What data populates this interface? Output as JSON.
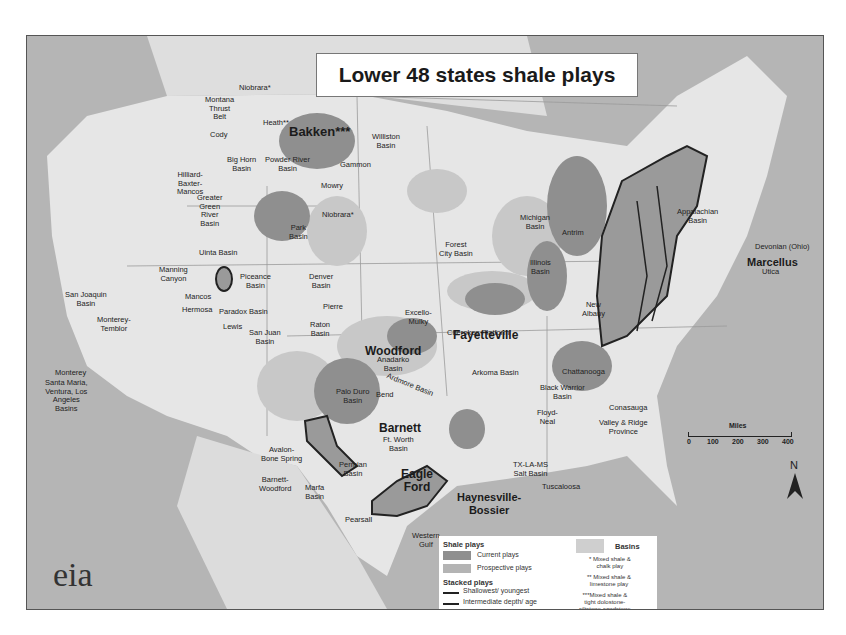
{
  "title": "Lower 48 states shale plays",
  "logo": "eia",
  "big_labels": {
    "bakken": "Bakken***",
    "marcellus": "Marcellus",
    "woodford": "Woodford",
    "fayetteville": "Fayetteville",
    "barnett": "Barnett",
    "eagle_ford": "Eagle\nFord",
    "haynesville": "Haynesville-\nBossier"
  },
  "labels": {
    "niobrara_n": "Niobrara*",
    "montana": "Montana\nThrust\nBelt",
    "heath": "Heath**",
    "williston": "Williston\nBasin",
    "gammon": "Gammon",
    "cody": "Cody",
    "bighorn": "Big Horn\nBasin",
    "powder": "Powder River\nBasin",
    "mowry": "Mowry",
    "hilliard": "Hilliard-\nBaxter-\nMancos",
    "greater_green": "Greater\nGreen\nRiver\nBasin",
    "niobrara_s": "Niobrara*",
    "park": "Park\nBasin",
    "uinta": "Uinta Basin",
    "manning": "Manning\nCanyon",
    "mancos": "Mancos",
    "hermosa": "Hermosa",
    "piceance": "Piceance\nBasin",
    "denver": "Denver\nBasin",
    "paradox": "Paradox Basin",
    "lewis": "Lewis",
    "san_juan": "San Juan\nBasin",
    "pierre": "Pierre",
    "raton": "Raton\nBasin",
    "san_joaquin": "San Joaquin\nBasin",
    "monterey_temblor": "Monterey-\nTemblor",
    "monterey": "Monterey",
    "santa_maria": "Santa Maria,\nVentura, Los\nAngeles\nBasins",
    "forest_city": "Forest\nCity Basin",
    "michigan": "Michigan\nBasin",
    "antrim": "Antrim",
    "illinois": "Illinois\nBasin",
    "new_albany": "New\nAlbany",
    "appalachian": "Appalachian\nBasin",
    "devonian": "Devonian (Ohio)",
    "utica": "Utica",
    "excello": "Excello-\nMulky",
    "cherokee": "Cherokee Platform",
    "anadarko": "Anadarko\nBasin",
    "ardmore": "Ardmore Basin",
    "arkoma": "Arkoma Basin",
    "palo_duro": "Palo Duro\nBasin",
    "bend": "Bend",
    "avalon": "Avalon-\nBone Spring",
    "barnett_woodford": "Barnett-\nWoodford",
    "marfa": "Marfa\nBasin",
    "permian": "Permian\nBasin",
    "ft_worth": "Ft. Worth\nBasin",
    "pearsall": "Pearsall",
    "western_gulf": "Western\nGulf",
    "tx_la_ms": "TX-LA-MS\nSalt Basin",
    "tuscaloosa": "Tuscaloosa",
    "chattanooga": "Chattanooga",
    "black_warrior": "Black Warrior\nBasin",
    "floyd": "Floyd-\nNeal",
    "conasauga": "Conasauga",
    "valley_ridge": "Valley & Ridge\nProvince"
  },
  "legend": {
    "shale_plays_title": "Shale plays",
    "current": "Current plays",
    "prospective": "Prospective plays",
    "stacked_title": "Stacked plays",
    "shallowest": "Shallowest/ youngest",
    "intermediate": "Intermediate depth/ age",
    "deepest": "Deepest/ oldest",
    "basins": "Basins",
    "note1": "* Mixed shale &\nchalk play",
    "note2": "** Mixed shale &\nlimestone play",
    "note3": "***Mixed shale &\ntight dolostone-\nsiltstone-sandstone",
    "colors": {
      "current": "#8f8f8f",
      "prospective": "#b4b4b4",
      "basins": "#cfcfcf"
    }
  },
  "scale": {
    "title": "Miles",
    "ticks": [
      "0",
      "100",
      "200",
      "300",
      "400"
    ]
  },
  "north": "N"
}
